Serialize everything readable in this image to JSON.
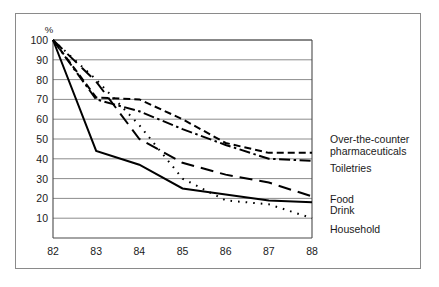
{
  "chart_data": {
    "type": "line",
    "title": "",
    "subtitle": "",
    "xlabel": "",
    "ylabel": "%",
    "y_axis_unit_label": "%",
    "x": [
      82,
      83,
      84,
      85,
      86,
      87,
      88
    ],
    "xticklabels": [
      "82",
      "83",
      "84",
      "85",
      "86",
      "87",
      "88"
    ],
    "yticklabels": [
      "100",
      "90",
      "80",
      "70",
      "60",
      "50",
      "40",
      "30",
      "20",
      "10"
    ],
    "yticks": [
      100,
      90,
      80,
      70,
      60,
      50,
      40,
      30,
      20,
      10
    ],
    "xlim": [
      82,
      88
    ],
    "ylim": [
      0,
      100
    ],
    "grid": "horizontal",
    "legend_position": "right-inline-labels",
    "series": [
      {
        "name": "Over-the-counter pharmaceuticals",
        "linestyle": "dashed",
        "color": "#000000",
        "values": [
          100,
          71,
          70,
          60,
          48,
          43,
          43
        ]
      },
      {
        "name": "Toiletries",
        "linestyle": "dash-dot",
        "color": "#000000",
        "values": [
          100,
          70,
          64,
          55,
          47,
          40,
          39
        ]
      },
      {
        "name": "Food",
        "linestyle": "long-dash",
        "color": "#000000",
        "values": [
          100,
          79,
          50,
          38,
          32,
          28,
          21
        ]
      },
      {
        "name": "Drink",
        "linestyle": "solid",
        "color": "#000000",
        "values": [
          100,
          44,
          37,
          25,
          22,
          19,
          18
        ]
      },
      {
        "name": "Household",
        "linestyle": "dotted",
        "color": "#000000",
        "values": [
          100,
          80,
          57,
          30,
          19,
          17,
          10
        ]
      }
    ]
  },
  "axis": {
    "percent_label": "%",
    "y_labels": [
      "100",
      "90",
      "80",
      "70",
      "60",
      "50",
      "40",
      "30",
      "20",
      "10"
    ],
    "x_labels": [
      "82",
      "83",
      "84",
      "85",
      "86",
      "87",
      "88"
    ]
  },
  "legend": {
    "items": [
      {
        "label_line1": "Over-the-counter",
        "label_line2": "pharmaceuticals"
      },
      {
        "label_line1": "Toiletries",
        "label_line2": ""
      },
      {
        "label_line1": "Food",
        "label_line2": ""
      },
      {
        "label_line1": "Drink",
        "label_line2": ""
      },
      {
        "label_line1": "Household",
        "label_line2": ""
      }
    ]
  },
  "colors": {
    "line": "#000000",
    "grid": "#6e6e6e",
    "frame": "#4a4a4a",
    "outer_border": "#8a8a8a",
    "background": "#ffffff",
    "text": "#1a1a1a"
  }
}
